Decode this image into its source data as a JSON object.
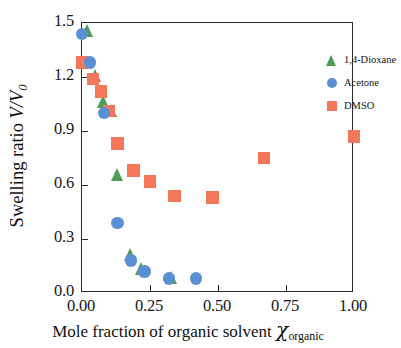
{
  "chart_data": {
    "type": "scatter",
    "title": "",
    "xlabel": "Mole fraction of organic solvent",
    "xlabel_symbol": "χ",
    "xlabel_symbol_sub": "organic",
    "ylabel": "Swelling ratio",
    "ylabel_symbol": "V/V",
    "ylabel_symbol_sub": "0",
    "xlim": [
      0.0,
      1.0
    ],
    "ylim": [
      0.0,
      1.5
    ],
    "xticks": [
      "0.00",
      "0.25",
      "0.50",
      "0.75",
      "1.00"
    ],
    "xtick_values": [
      0.0,
      0.25,
      0.5,
      0.75,
      1.0
    ],
    "yticks": [
      "0.0",
      "0.3",
      "0.6",
      "0.9",
      "1.2",
      "1.5"
    ],
    "ytick_values": [
      0.0,
      0.3,
      0.6,
      0.9,
      1.2,
      1.5
    ],
    "grid": false,
    "legend_position": "top-right",
    "series": [
      {
        "name": "1,4-Dioxane",
        "marker": "triangle",
        "color": "#4e9c56",
        "points": [
          {
            "x": 0.02,
            "y": 1.45
          },
          {
            "x": 0.05,
            "y": 1.2
          },
          {
            "x": 0.08,
            "y": 1.06
          },
          {
            "x": 0.11,
            "y": 1.01
          },
          {
            "x": 0.13,
            "y": 0.65
          },
          {
            "x": 0.18,
            "y": 0.21
          },
          {
            "x": 0.22,
            "y": 0.13
          },
          {
            "x": 0.33,
            "y": 0.08
          }
        ]
      },
      {
        "name": "Acetone",
        "marker": "circle",
        "color": "#5b8fd4",
        "points": [
          {
            "x": 0.0,
            "y": 1.44
          },
          {
            "x": 0.03,
            "y": 1.28
          },
          {
            "x": 0.08,
            "y": 1.0
          },
          {
            "x": 0.13,
            "y": 0.39
          },
          {
            "x": 0.18,
            "y": 0.18
          },
          {
            "x": 0.23,
            "y": 0.12
          },
          {
            "x": 0.32,
            "y": 0.08
          },
          {
            "x": 0.42,
            "y": 0.08
          }
        ]
      },
      {
        "name": "DMSO",
        "marker": "square",
        "color": "#f4775c",
        "points": [
          {
            "x": 0.0,
            "y": 1.28
          },
          {
            "x": 0.04,
            "y": 1.19
          },
          {
            "x": 0.07,
            "y": 1.12
          },
          {
            "x": 0.1,
            "y": 1.01
          },
          {
            "x": 0.13,
            "y": 0.83
          },
          {
            "x": 0.19,
            "y": 0.68
          },
          {
            "x": 0.25,
            "y": 0.62
          },
          {
            "x": 0.34,
            "y": 0.54
          },
          {
            "x": 0.48,
            "y": 0.53
          },
          {
            "x": 0.67,
            "y": 0.75
          },
          {
            "x": 1.0,
            "y": 0.87
          }
        ]
      }
    ]
  },
  "legend": {
    "items": [
      {
        "label": "1,4-Dioxane"
      },
      {
        "label": "Acetone"
      },
      {
        "label": "DMSO"
      }
    ]
  },
  "axes": {
    "y_title_text": "Swelling ratio",
    "y_title_symbol": "V/V",
    "y_title_sub": "0",
    "x_title_text": "Mole fraction of organic solvent",
    "x_title_symbol": "χ",
    "x_title_sub": "organic"
  }
}
